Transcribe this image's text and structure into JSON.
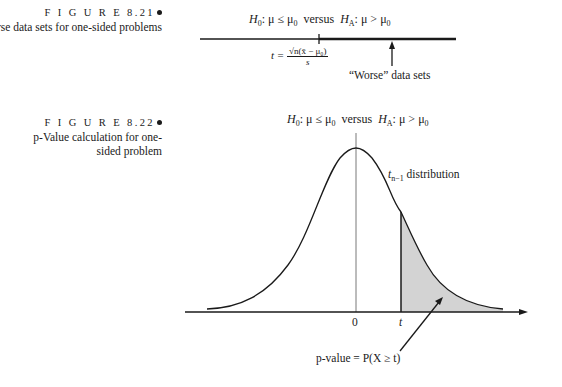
{
  "figure_821": {
    "label": "F I G U R E  8.21",
    "title": "Worse data sets for one-sided problems",
    "hypothesis": {
      "h0_sym": "H",
      "h0_sub": "0",
      "h0_rel": ": μ ≤ μ",
      "h0_rel_sub": "0",
      "versus": "versus",
      "ha_sym": "H",
      "ha_sub": "A",
      "ha_rel": ": μ > μ",
      "ha_rel_sub": "0"
    },
    "statistic": {
      "lhs": "t =",
      "numerator": "√n(x̄ − μ₀)",
      "denominator": "s"
    },
    "arrow_label": "“Worse” data sets"
  },
  "figure_822": {
    "label": "F I G U R E  8.22",
    "title": "p-Value calculation for one-sided problem",
    "hypothesis": {
      "h0_sym": "H",
      "h0_sub": "0",
      "h0_rel": ": μ ≤ μ",
      "h0_rel_sub": "0",
      "versus": "versus",
      "ha_sym": "H",
      "ha_sub": "A",
      "ha_rel": ": μ > μ",
      "ha_rel_sub": "0"
    },
    "distribution_label_sym": "t",
    "distribution_label_sub": "n−1",
    "distribution_label_text": "distribution",
    "axis_ticks": [
      "0",
      "t"
    ],
    "pvalue_label": "p-value = P(X ≥ t)",
    "colors": {
      "shade": "#d3d3d3",
      "ink": "#1a1a1a"
    }
  }
}
